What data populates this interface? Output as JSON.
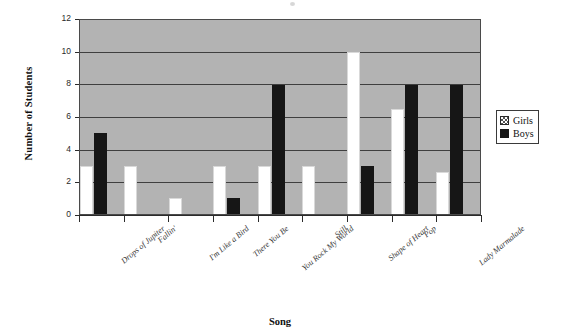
{
  "chart_data": {
    "type": "bar",
    "title": "",
    "xlabel": "Song",
    "ylabel": "Number of Students",
    "ylim": [
      0,
      12
    ],
    "y_ticks": [
      0,
      2,
      4,
      6,
      8,
      10,
      12
    ],
    "grid": true,
    "legend_position": "right",
    "plot_background": "#b3b3b3",
    "categories": [
      "Drops of Jupiter",
      "Fallin'",
      "I'm Like a Bird",
      "There You Be",
      "You Rock My World",
      "Still",
      "Shape of Heart",
      "Pop",
      "Lady Marmalade"
    ],
    "series": [
      {
        "name": "Girls",
        "color": "#ffffff",
        "values": [
          3,
          3,
          1,
          3,
          3,
          3,
          10,
          6.5,
          2.6
        ]
      },
      {
        "name": "Boys",
        "color": "#161616",
        "values": [
          5,
          0,
          0,
          1,
          8,
          0,
          3,
          8,
          8
        ]
      }
    ]
  },
  "legend": {
    "items": [
      {
        "label": "Girls",
        "swatch": "hatched-swatch-icon"
      },
      {
        "label": "Boys",
        "swatch": "solid-black-swatch-icon"
      }
    ]
  }
}
